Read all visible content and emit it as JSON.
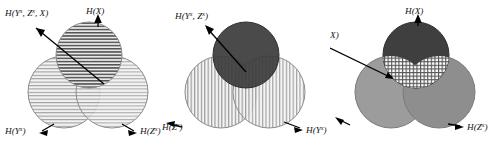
{
  "figure": {
    "title": "",
    "type": "venn-diagram-triple",
    "panel_count": 3
  },
  "panels": [
    {
      "id": "panel-left",
      "name": "entropy-decomposition-left",
      "circles": [
        {
          "name": "circle-X-top",
          "fill": "horizontal-stripes-dark",
          "color": "#e8e8e8"
        },
        {
          "name": "circle-Yx-left",
          "fill": "horizontal-stripes-light",
          "color": "#ededed"
        },
        {
          "name": "circle-Zx-right",
          "fill": "horizontal-stripes-light",
          "color": "#ededed"
        }
      ],
      "labels": {
        "top_left": {
          "text": "H(Y",
          "sup1": "x",
          "mid": ", Z",
          "sup2": "x",
          "tail": ", X)"
        },
        "top_right": {
          "text": "H(X)"
        },
        "bottom_left": {
          "text": "H(Y",
          "sup1": "x",
          "tail": ")"
        },
        "bottom_right": {
          "text": "H(Z",
          "sup1": "x",
          "tail": ")"
        }
      },
      "label_strings": {
        "top_left": "H(Yˣ, Zˣ, X)",
        "top_right": "H(X)",
        "bottom_left": "H(Yˣ)",
        "bottom_right": "H(Zˣ)"
      }
    },
    {
      "id": "panel-mid",
      "name": "entropy-decomposition-middle",
      "circles": [
        {
          "name": "circle-X-top",
          "fill": "solid-dark",
          "color": "#3c3c3c"
        },
        {
          "name": "circle-Zx-left",
          "fill": "vertical-stripes",
          "color": "#f0f0f0"
        },
        {
          "name": "circle-Yx-right",
          "fill": "vertical-stripes",
          "color": "#f0f0f0"
        }
      ],
      "labels": {
        "top_left": {
          "text": "H(Y",
          "sup1": "x",
          "mid": ", Z",
          "sup2": "x",
          "tail": ")"
        },
        "bottom_left": {
          "text": "H(Z",
          "sup1": "x",
          "tail": ")"
        },
        "bottom_right": {
          "text": "H(Y",
          "sup1": "x",
          "tail": ")"
        }
      },
      "label_strings": {
        "top_left": "H(Yˣ, Zˣ)",
        "bottom_left": "H(Zˣ)",
        "bottom_right": "H(Yˣ)"
      }
    },
    {
      "id": "panel-right",
      "name": "mutual-information-right",
      "circles": [
        {
          "name": "circle-X-top",
          "fill": "solid-dark",
          "color": "#3f3f3f"
        },
        {
          "name": "circle-Yx-left",
          "fill": "solid-medium",
          "color": "#9a9a9a"
        },
        {
          "name": "circle-Zx-right",
          "fill": "solid-medium",
          "color": "#8f8f8f"
        },
        {
          "name": "region-intersection",
          "fill": "crosshatch",
          "color": "#ffffff"
        }
      ],
      "labels": {
        "top_left": {
          "text": "I(Y",
          "sup1": "x",
          "mid": ", Z",
          "sup2": "x−",
          "tail": ", X)"
        },
        "top_right": {
          "text": "H(X)"
        },
        "bottom_left": {
          "text": "H(Y",
          "sup1": "x",
          "tail": ")"
        },
        "bottom_right": {
          "text": "H(Z",
          "sup1": "x",
          "tail": ")"
        }
      },
      "label_strings": {
        "top_left": "I(Yˣ, Zˣ⁻, X)",
        "top_right": "H(X)",
        "bottom_left": "H(Yˣ)",
        "bottom_right": "H(Zˣ)"
      }
    }
  ],
  "colors": {
    "background": "#ffffff",
    "stroke": "#6e6e6e",
    "text": "#111111",
    "arrow": "#000000",
    "dark_fill": "#3c3c3c",
    "medium_fill": "#969696",
    "light_fill": "#ededed"
  }
}
